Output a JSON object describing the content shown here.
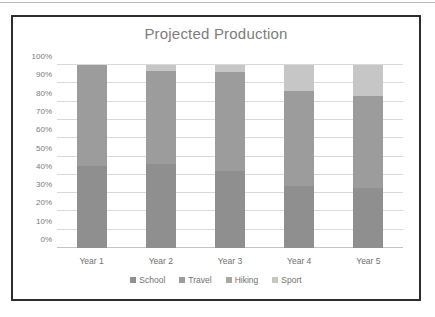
{
  "chart_data": {
    "type": "bar",
    "subtype": "100% stacked column",
    "title": "Projected Production",
    "xlabel": "",
    "ylabel": "",
    "categories": [
      "Year 1",
      "Year 2",
      "Year 3",
      "Year 4",
      "Year 5"
    ],
    "series": [
      {
        "name": "School",
        "color": "#8f8f8f",
        "values": [
          45,
          46,
          42,
          34,
          33
        ]
      },
      {
        "name": "Travel",
        "color": "#9c9c9c",
        "values": [
          55,
          51,
          54,
          52,
          50
        ]
      },
      {
        "name": "Hiking",
        "color": "#a6a6a6",
        "values": [
          0,
          0,
          0,
          0,
          0
        ]
      },
      {
        "name": "Sport",
        "color": "#c6c6c6",
        "values": [
          0,
          3,
          4,
          14,
          17
        ]
      }
    ],
    "ylim": [
      0,
      100
    ],
    "ytick_labels": [
      "0%",
      "10%",
      "20%",
      "30%",
      "40%",
      "50%",
      "60%",
      "70%",
      "80%",
      "90%",
      "100%"
    ],
    "ytick_values": [
      0,
      10,
      20,
      30,
      40,
      50,
      60,
      70,
      80,
      90,
      100
    ],
    "grid": true,
    "legend_position": "bottom",
    "legend": [
      "School",
      "Travel",
      "Hiking",
      "Sport"
    ]
  },
  "colors": {
    "frame": "#2e2e2e",
    "title_text": "#7d7d7d",
    "tick_text": "#7a7a7a",
    "gridline": "#d9d9d9",
    "background": "#ffffff"
  }
}
